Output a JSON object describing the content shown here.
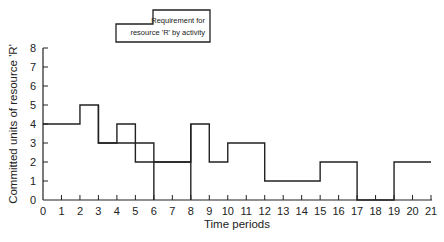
{
  "chart_data": {
    "type": "line",
    "subtype": "step",
    "title": "",
    "xlabel": "Time periods",
    "ylabel": "Committed units of resource 'R'",
    "xlim": [
      0,
      21
    ],
    "ylim": [
      0,
      8
    ],
    "x_ticks": [
      "0",
      "1",
      "2",
      "3",
      "4",
      "5",
      "6",
      "7",
      "8",
      "9",
      "10",
      "11",
      "12",
      "13",
      "14",
      "15",
      "16",
      "17",
      "18",
      "19",
      "20",
      "21"
    ],
    "y_ticks": [
      "0",
      "1",
      "2",
      "3",
      "4",
      "5",
      "6",
      "7",
      "8"
    ],
    "grid": false,
    "legend": {
      "position": "top",
      "entries": [
        "Requirement for resource 'R' by activity"
      ],
      "line1": "Requirement for",
      "line2": "resource 'R' by activity"
    },
    "series": [
      {
        "name": "Activity requirement profile (upper outline)",
        "points": [
          [
            0,
            4
          ],
          [
            2,
            4
          ],
          [
            2,
            5
          ],
          [
            3,
            5
          ],
          [
            3,
            3
          ],
          [
            4,
            3
          ],
          [
            4,
            4
          ],
          [
            5,
            4
          ],
          [
            5,
            3
          ],
          [
            6,
            3
          ],
          [
            6,
            0
          ]
        ]
      },
      {
        "name": "Activity requirement profile (lower outline)",
        "points": [
          [
            3,
            5
          ],
          [
            3,
            3
          ],
          [
            5,
            3
          ],
          [
            5,
            2
          ],
          [
            8,
            2
          ],
          [
            8,
            4
          ],
          [
            9,
            4
          ],
          [
            9,
            2
          ],
          [
            10,
            2
          ],
          [
            10,
            3
          ],
          [
            12,
            3
          ],
          [
            12,
            1
          ],
          [
            15,
            1
          ],
          [
            15,
            2
          ],
          [
            17,
            2
          ],
          [
            17,
            0
          ],
          [
            19,
            0
          ],
          [
            19,
            2
          ],
          [
            21,
            2
          ]
        ]
      },
      {
        "name": "Vertical separator at period 8",
        "points": [
          [
            8,
            0
          ],
          [
            8,
            4
          ]
        ]
      },
      {
        "name": "Inner step 6-8",
        "points": [
          [
            6,
            2
          ],
          [
            8,
            2
          ]
        ]
      }
    ],
    "segments_summary": [
      {
        "from": 0,
        "to": 2,
        "value": 4
      },
      {
        "from": 2,
        "to": 3,
        "value": 5
      },
      {
        "from": 3,
        "to": 4,
        "value": 3
      },
      {
        "from": 4,
        "to": 5,
        "value": 4
      },
      {
        "from": 5,
        "to": 6,
        "value": 3
      },
      {
        "from": 6,
        "to": 8,
        "value": 2
      },
      {
        "from": 8,
        "to": 9,
        "value": 4
      },
      {
        "from": 9,
        "to": 10,
        "value": 2
      },
      {
        "from": 10,
        "to": 12,
        "value": 3
      },
      {
        "from": 12,
        "to": 15,
        "value": 1
      },
      {
        "from": 15,
        "to": 17,
        "value": 2
      },
      {
        "from": 17,
        "to": 19,
        "value": 0
      },
      {
        "from": 19,
        "to": 21,
        "value": 2
      }
    ]
  }
}
